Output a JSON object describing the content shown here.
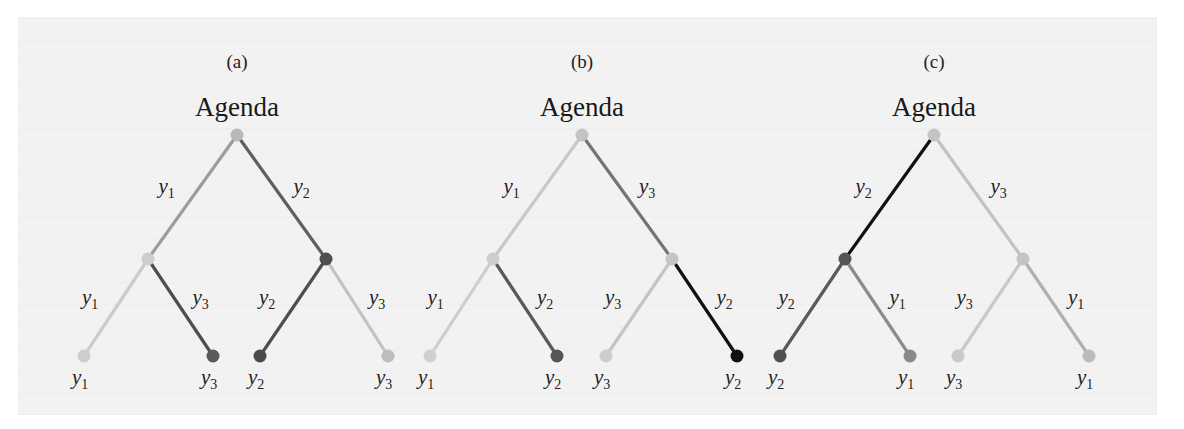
{
  "figure": {
    "background_color": "#f2f2f2",
    "trees": [
      {
        "id": "a",
        "label": "(a)",
        "title": "Agenda",
        "root": {
          "x": 237,
          "y": 135,
          "color": "#b9b9b9"
        },
        "mids": [
          {
            "x": 148,
            "y": 259,
            "color": "#cdcdcd"
          },
          {
            "x": 326,
            "y": 259,
            "color": "#4e4e4e"
          }
        ],
        "leaves": [
          {
            "x": 84,
            "y": 356,
            "color": "#cdcdcd",
            "var": "y",
            "sub": "1"
          },
          {
            "x": 213,
            "y": 356,
            "color": "#5a5a5a",
            "var": "y",
            "sub": "3"
          },
          {
            "x": 260,
            "y": 356,
            "color": "#4a4a4a",
            "var": "y",
            "sub": "2"
          },
          {
            "x": 388,
            "y": 356,
            "color": "#bdbdbd",
            "var": "y",
            "sub": "3"
          }
        ],
        "edges": [
          {
            "from": "root",
            "to": "mid0",
            "color": "#9c9c9c",
            "var": "y",
            "sub": "1",
            "side": "left"
          },
          {
            "from": "root",
            "to": "mid1",
            "color": "#5e5e5e",
            "var": "y",
            "sub": "2",
            "side": "right"
          },
          {
            "from": "mid0",
            "to": "leaf0",
            "color": "#cbcbcb",
            "var": "y",
            "sub": "1",
            "side": "left"
          },
          {
            "from": "mid0",
            "to": "leaf1",
            "color": "#4e4e4e",
            "var": "y",
            "sub": "3",
            "side": "right"
          },
          {
            "from": "mid1",
            "to": "leaf2",
            "color": "#4e4e4e",
            "var": "y",
            "sub": "2",
            "side": "left"
          },
          {
            "from": "mid1",
            "to": "leaf3",
            "color": "#c2c2c2",
            "var": "y",
            "sub": "3",
            "side": "right"
          }
        ]
      },
      {
        "id": "b",
        "label": "(b)",
        "title": "Agenda",
        "root": {
          "x": 582,
          "y": 135,
          "color": "#c4c4c4"
        },
        "mids": [
          {
            "x": 493,
            "y": 259,
            "color": "#cdcdcd"
          },
          {
            "x": 672,
            "y": 259,
            "color": "#c4c4c4"
          }
        ],
        "leaves": [
          {
            "x": 430,
            "y": 356,
            "color": "#d0d0d0",
            "var": "y",
            "sub": "1"
          },
          {
            "x": 557,
            "y": 356,
            "color": "#555555",
            "var": "y",
            "sub": "2"
          },
          {
            "x": 606,
            "y": 356,
            "color": "#cdcdcd",
            "var": "y",
            "sub": "3"
          },
          {
            "x": 737,
            "y": 356,
            "color": "#111111",
            "var": "y",
            "sub": "2"
          }
        ],
        "edges": [
          {
            "from": "root",
            "to": "mid0",
            "color": "#c8c8c8",
            "var": "y",
            "sub": "1",
            "side": "left"
          },
          {
            "from": "root",
            "to": "mid1",
            "color": "#747474",
            "var": "y",
            "sub": "3",
            "side": "right"
          },
          {
            "from": "mid0",
            "to": "leaf0",
            "color": "#cdcdcd",
            "var": "y",
            "sub": "1",
            "side": "left"
          },
          {
            "from": "mid0",
            "to": "leaf1",
            "color": "#595959",
            "var": "y",
            "sub": "2",
            "side": "right"
          },
          {
            "from": "mid1",
            "to": "leaf2",
            "color": "#c4c4c4",
            "var": "y",
            "sub": "3",
            "side": "left"
          },
          {
            "from": "mid1",
            "to": "leaf3",
            "color": "#111111",
            "var": "y",
            "sub": "2",
            "side": "right"
          }
        ]
      },
      {
        "id": "c",
        "label": "(c)",
        "title": "Agenda",
        "root": {
          "x": 934,
          "y": 135,
          "color": "#c4c4c4"
        },
        "mids": [
          {
            "x": 845,
            "y": 259,
            "color": "#555555"
          },
          {
            "x": 1023,
            "y": 259,
            "color": "#c4c4c4"
          }
        ],
        "leaves": [
          {
            "x": 780,
            "y": 356,
            "color": "#505050",
            "var": "y",
            "sub": "2"
          },
          {
            "x": 910,
            "y": 356,
            "color": "#8a8a8a",
            "var": "y",
            "sub": "1"
          },
          {
            "x": 958,
            "y": 356,
            "color": "#c8c8c8",
            "var": "y",
            "sub": "3"
          },
          {
            "x": 1089,
            "y": 356,
            "color": "#bbbbbb",
            "var": "y",
            "sub": "1"
          }
        ],
        "edges": [
          {
            "from": "root",
            "to": "mid0",
            "color": "#111111",
            "var": "y",
            "sub": "2",
            "side": "left"
          },
          {
            "from": "root",
            "to": "mid1",
            "color": "#c2c2c2",
            "var": "y",
            "sub": "3",
            "side": "right"
          },
          {
            "from": "mid0",
            "to": "leaf0",
            "color": "#5a5a5a",
            "var": "y",
            "sub": "2",
            "side": "left"
          },
          {
            "from": "mid0",
            "to": "leaf1",
            "color": "#8c8c8c",
            "var": "y",
            "sub": "1",
            "side": "right"
          },
          {
            "from": "mid1",
            "to": "leaf2",
            "color": "#c8c8c8",
            "var": "y",
            "sub": "3",
            "side": "left"
          },
          {
            "from": "mid1",
            "to": "leaf3",
            "color": "#b0b0b0",
            "var": "y",
            "sub": "1",
            "side": "right"
          }
        ]
      }
    ]
  }
}
